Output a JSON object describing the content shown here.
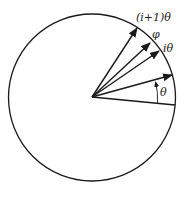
{
  "diagram": {
    "type": "circle-angle-vectors",
    "labels": {
      "i_plus_1_theta": "(i+1)θ",
      "phi": "φ",
      "i_theta": "iθ",
      "theta": "θ"
    },
    "colors": {
      "stroke": "#1a1a1a",
      "background": "#ffffff"
    }
  }
}
